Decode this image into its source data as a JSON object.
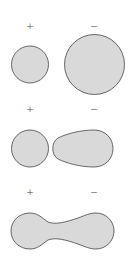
{
  "diagram": {
    "fill": "#d9d9d9",
    "stroke": "#444444",
    "stages": [
      {
        "positive_label": "+",
        "negative_label": "−",
        "description": "separate small and large spheres"
      },
      {
        "positive_label": "+",
        "negative_label": "−",
        "description": "sphere beside deformed drop"
      },
      {
        "positive_label": "+",
        "negative_label": "−",
        "description": "merged dumbbell shape"
      }
    ]
  }
}
